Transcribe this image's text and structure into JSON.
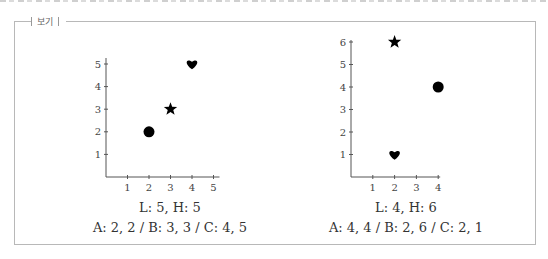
{
  "box_label": "보기",
  "chart_data": [
    {
      "type": "scatter",
      "name": "left",
      "x_ticks": [
        1,
        2,
        3,
        4,
        5
      ],
      "y_ticks": [
        1,
        2,
        3,
        4,
        5
      ],
      "xlim": [
        0,
        5
      ],
      "ylim": [
        0,
        5
      ],
      "grid": false,
      "points": [
        {
          "label": "A",
          "x": 2,
          "y": 2,
          "marker": "circle",
          "glyph": "●"
        },
        {
          "label": "B",
          "x": 3,
          "y": 3,
          "marker": "star",
          "glyph": "★"
        },
        {
          "label": "C",
          "x": 4,
          "y": 5,
          "marker": "heart",
          "glyph": "♥"
        }
      ],
      "caption_line1": "L: 5, H: 5",
      "caption_line2": "A: 2, 2 / B: 3, 3 / C: 4, 5"
    },
    {
      "type": "scatter",
      "name": "right",
      "x_ticks": [
        1,
        2,
        3,
        4
      ],
      "y_ticks": [
        1,
        2,
        3,
        4,
        5,
        6
      ],
      "xlim": [
        0,
        4
      ],
      "ylim": [
        0,
        6
      ],
      "grid": false,
      "points": [
        {
          "label": "A",
          "x": 4,
          "y": 4,
          "marker": "circle",
          "glyph": "●"
        },
        {
          "label": "B",
          "x": 2,
          "y": 6,
          "marker": "star",
          "glyph": "★"
        },
        {
          "label": "C",
          "x": 2,
          "y": 1,
          "marker": "heart",
          "glyph": "♥"
        }
      ],
      "caption_line1": "L: 4, H: 6",
      "caption_line2": "A: 4, 4 / B: 2, 6 / C: 2, 1"
    }
  ]
}
